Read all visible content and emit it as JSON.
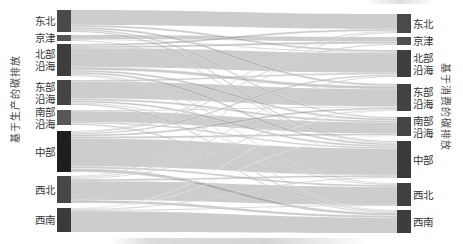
{
  "chart_data": {
    "type": "sankey",
    "title": "",
    "left_axis_title": "基于生产的碳排放",
    "right_axis_title": "基于消费的碳排放",
    "nodes_left": [
      {
        "id": "L0",
        "label": "东北",
        "lines": [
          "东北"
        ],
        "y0": 10,
        "y1": 32,
        "color": "#4a4a4a"
      },
      {
        "id": "L1",
        "label": "京津",
        "lines": [
          "京津"
        ],
        "y0": 35,
        "y1": 41,
        "color": "#555555"
      },
      {
        "id": "L2",
        "label": "北部沿海",
        "lines": [
          "北部",
          "沿海"
        ],
        "y0": 44,
        "y1": 76,
        "color": "#3e3e3e"
      },
      {
        "id": "L3",
        "label": "东部沿海",
        "lines": [
          "东部",
          "沿海"
        ],
        "y0": 80,
        "y1": 105,
        "color": "#444444"
      },
      {
        "id": "L4",
        "label": "南部沿海",
        "lines": [
          "南部",
          "沿海"
        ],
        "y0": 110,
        "y1": 125,
        "color": "#575757"
      },
      {
        "id": "L5",
        "label": "中部",
        "lines": [
          "中部"
        ],
        "y0": 131,
        "y1": 172,
        "color": "#1e1e1e"
      },
      {
        "id": "L6",
        "label": "西北",
        "lines": [
          "西北"
        ],
        "y0": 176,
        "y1": 203,
        "color": "#474747"
      },
      {
        "id": "L7",
        "label": "西南",
        "lines": [
          "西南"
        ],
        "y0": 208,
        "y1": 232,
        "color": "#3a3a3a"
      }
    ],
    "nodes_right": [
      {
        "id": "R0",
        "label": "东北",
        "lines": [
          "东北"
        ],
        "y0": 14,
        "y1": 33,
        "color": "#4a4a4a"
      },
      {
        "id": "R1",
        "label": "京津",
        "lines": [
          "京津"
        ],
        "y0": 37,
        "y1": 45,
        "color": "#4f4f4f"
      },
      {
        "id": "R2",
        "label": "北部沿海",
        "lines": [
          "北部",
          "沿海"
        ],
        "y0": 50,
        "y1": 77,
        "color": "#3f3f3f"
      },
      {
        "id": "R3",
        "label": "东部沿海",
        "lines": [
          "东部",
          "沿海"
        ],
        "y0": 84,
        "y1": 111,
        "color": "#424242"
      },
      {
        "id": "R4",
        "label": "南部沿海",
        "lines": [
          "南部",
          "沿海"
        ],
        "y0": 117,
        "y1": 136,
        "color": "#444444"
      },
      {
        "id": "R5",
        "label": "中部",
        "lines": [
          "中部"
        ],
        "y0": 141,
        "y1": 178,
        "color": "#3a3a3a"
      },
      {
        "id": "R6",
        "label": "西北",
        "lines": [
          "西北"
        ],
        "y0": 183,
        "y1": 206,
        "color": "#404040"
      },
      {
        "id": "R7",
        "label": "西南",
        "lines": [
          "西南"
        ],
        "y0": 210,
        "y1": 233,
        "color": "#3d3d3d"
      }
    ],
    "flows": [
      {
        "source": "东北",
        "target": "东北",
        "value": 15
      },
      {
        "source": "东北",
        "target": "北部沿海",
        "value": 2
      },
      {
        "source": "东北",
        "target": "东部沿海",
        "value": 2
      },
      {
        "source": "东北",
        "target": "中部",
        "value": 1.5
      },
      {
        "source": "东北",
        "target": "南部沿海",
        "value": 1.5
      },
      {
        "source": "京津",
        "target": "京津",
        "value": 4
      },
      {
        "source": "京津",
        "target": "北部沿海",
        "value": 1
      },
      {
        "source": "京津",
        "target": "中部",
        "value": 1
      },
      {
        "source": "北部沿海",
        "target": "东北",
        "value": 2
      },
      {
        "source": "北部沿海",
        "target": "京津",
        "value": 2
      },
      {
        "source": "北部沿海",
        "target": "北部沿海",
        "value": 19
      },
      {
        "source": "北部沿海",
        "target": "东部沿海",
        "value": 3
      },
      {
        "source": "北部沿海",
        "target": "南部沿海",
        "value": 2
      },
      {
        "source": "北部沿海",
        "target": "中部",
        "value": 2
      },
      {
        "source": "北部沿海",
        "target": "西北",
        "value": 1
      },
      {
        "source": "北部沿海",
        "target": "西南",
        "value": 1
      },
      {
        "source": "东部沿海",
        "target": "东部沿海",
        "value": 17
      },
      {
        "source": "东部沿海",
        "target": "北部沿海",
        "value": 1.5
      },
      {
        "source": "东部沿海",
        "target": "南部沿海",
        "value": 2
      },
      {
        "source": "东部沿海",
        "target": "中部",
        "value": 2
      },
      {
        "source": "东部沿海",
        "target": "西北",
        "value": 1
      },
      {
        "source": "东部沿海",
        "target": "西南",
        "value": 1.5
      },
      {
        "source": "南部沿海",
        "target": "南部沿海",
        "value": 11
      },
      {
        "source": "南部沿海",
        "target": "东部沿海",
        "value": 1
      },
      {
        "source": "南部沿海",
        "target": "中部",
        "value": 1.5
      },
      {
        "source": "南部沿海",
        "target": "西南",
        "value": 1.5
      },
      {
        "source": "中部",
        "target": "东北",
        "value": 1
      },
      {
        "source": "中部",
        "target": "京津",
        "value": 1
      },
      {
        "source": "中部",
        "target": "北部沿海",
        "value": 1.5
      },
      {
        "source": "中部",
        "target": "东部沿海",
        "value": 2
      },
      {
        "source": "中部",
        "target": "南部沿海",
        "value": 2
      },
      {
        "source": "中部",
        "target": "中部",
        "value": 28
      },
      {
        "source": "中部",
        "target": "西北",
        "value": 2
      },
      {
        "source": "中部",
        "target": "西南",
        "value": 3.5
      },
      {
        "source": "西北",
        "target": "东北",
        "value": 1
      },
      {
        "source": "西北",
        "target": "北部沿海",
        "value": 1
      },
      {
        "source": "西北",
        "target": "东部沿海",
        "value": 1
      },
      {
        "source": "西北",
        "target": "中部",
        "value": 2
      },
      {
        "source": "西北",
        "target": "西北",
        "value": 19
      },
      {
        "source": "西北",
        "target": "西南",
        "value": 3
      },
      {
        "source": "西南",
        "target": "东部沿海",
        "value": 0.5
      },
      {
        "source": "西南",
        "target": "南部沿海",
        "value": 0.5
      },
      {
        "source": "西南",
        "target": "中部",
        "value": 1
      },
      {
        "source": "西南",
        "target": "西北",
        "value": 1
      },
      {
        "source": "西南",
        "target": "西南",
        "value": 21
      }
    ],
    "layout": {
      "left_node_x": 57,
      "right_node_x": 397,
      "node_width": 14
    },
    "legend": null,
    "grid": false
  },
  "labels": {
    "left_axis": "基于生产的碳排放",
    "right_axis": "基于消费的碳排放"
  }
}
